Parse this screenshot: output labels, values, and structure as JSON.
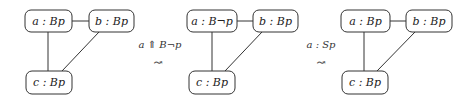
{
  "graphs": [
    {
      "nodes": {
        "a": "a : Bp",
        "b": "b : Bp",
        "c": "c : Bp"
      }
    },
    {
      "nodes": {
        "a": "a : B¬p",
        "b": "b : Bp",
        "c": "c : Bp"
      }
    },
    {
      "nodes": {
        "a": "a : Bp",
        "b": "b : Bp",
        "c": "c : Bp"
      }
    }
  ],
  "transitions": [
    {
      "label": "a ⇑ B¬p",
      "arrow": "↝"
    },
    {
      "label": "a : Sp",
      "arrow": "↝"
    }
  ]
}
